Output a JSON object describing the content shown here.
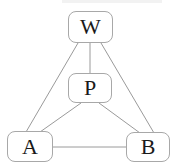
{
  "diagram": {
    "type": "graph",
    "nodes": [
      {
        "id": "W",
        "label": "W",
        "x": 68,
        "y": 11,
        "w": 45,
        "h": 32
      },
      {
        "id": "P",
        "label": "P",
        "x": 68,
        "y": 73,
        "w": 44,
        "h": 30
      },
      {
        "id": "A",
        "label": "A",
        "x": 7,
        "y": 131,
        "w": 46,
        "h": 31
      },
      {
        "id": "B",
        "label": "B",
        "x": 126,
        "y": 132,
        "w": 44,
        "h": 30
      }
    ],
    "edges": [
      {
        "from": "W",
        "to": "A"
      },
      {
        "from": "W",
        "to": "P"
      },
      {
        "from": "W",
        "to": "B"
      },
      {
        "from": "P",
        "to": "A"
      },
      {
        "from": "P",
        "to": "B"
      },
      {
        "from": "A",
        "to": "B"
      }
    ],
    "colors": {
      "edge": "#9a9a9a",
      "node_border": "#a8a8a8",
      "text": "#1a1a1a",
      "background": "#ffffff"
    }
  }
}
